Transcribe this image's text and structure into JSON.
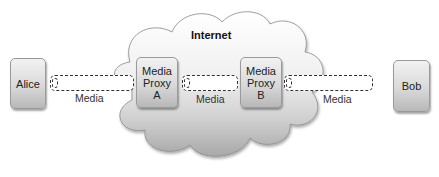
{
  "diagram": {
    "cloud": {
      "label": "Internet"
    },
    "nodes": {
      "alice": {
        "label": "Alice"
      },
      "proxy_a": {
        "line1": "Media",
        "line2": "Proxy",
        "line3": "A"
      },
      "proxy_b": {
        "line1": "Media",
        "line2": "Proxy",
        "line3": "B"
      },
      "bob": {
        "label": "Bob"
      }
    },
    "links": [
      {
        "from": "Alice",
        "to": "Media Proxy A",
        "label": "Media"
      },
      {
        "from": "Media Proxy A",
        "to": "Media Proxy B",
        "label": "Media"
      },
      {
        "from": "Media Proxy B",
        "to": "Bob",
        "label": "Media"
      }
    ],
    "colors": {
      "node_top": "#f2f2f2",
      "node_bottom": "#b8b8b8",
      "cloud_top": "#ffffff",
      "cloud_bottom": "#a8a8a8",
      "dash": "#333333"
    }
  }
}
